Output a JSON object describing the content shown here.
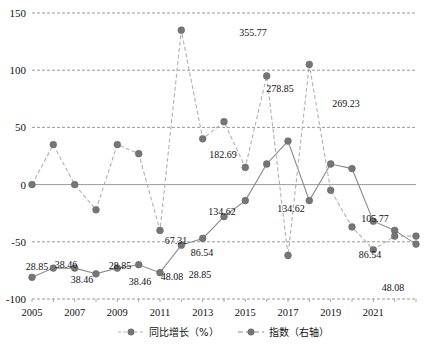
{
  "chart_data": {
    "type": "line",
    "title": "",
    "xlabel": "",
    "ylabel": "",
    "ylim": [
      -100,
      150
    ],
    "y_ticks": [
      150,
      100,
      50,
      0,
      -50,
      -100
    ],
    "grid": true,
    "legend_position": "bottom",
    "x": [
      2005,
      2006,
      2007,
      2008,
      2009,
      2010,
      2011,
      2012,
      2013,
      2014,
      2015,
      2016,
      2017,
      2018,
      2019,
      2020,
      2021,
      2022
    ],
    "x_tick_labels": [
      "2005",
      "2007",
      "2009",
      "2011",
      "2013",
      "2015",
      "2017",
      "2019",
      "2021"
    ],
    "x_ticks": [
      2005,
      2007,
      2009,
      2011,
      2013,
      2015,
      2017,
      2019,
      2021
    ],
    "series": [
      {
        "name": "同比增长（%）",
        "axis": "left",
        "style": "dashed",
        "color": "#a6a6a6",
        "marker_color": "#7f7f7f",
        "values": [
          0,
          35,
          0,
          -22,
          35,
          27,
          -40,
          135,
          40,
          55,
          15,
          95,
          -62,
          105,
          -5,
          -37,
          -57,
          -45
        ],
        "labels": [
          "",
          "",
          "",
          "",
          "",
          "",
          "",
          "",
          "",
          "",
          "",
          "",
          "",
          "",
          "",
          "",
          "",
          ""
        ]
      },
      {
        "name": "指数（右轴）",
        "axis": "right",
        "style": "solid",
        "color": "#808080",
        "marker_color": "#7f7f7f",
        "values": [
          28.85,
          38.46,
          38.46,
          28.85,
          38.46,
          48.08,
          28.85,
          67.31,
          86.54,
          134.62,
          182.69,
          278.85,
          355.77,
          134.62,
          278.85,
          269.23,
          105.77,
          86.54
        ],
        "plot_values": [
          -81,
          -73,
          -73,
          -78,
          -73,
          -70,
          -77,
          -53,
          -47,
          -28,
          -14,
          18,
          38,
          -14,
          18,
          14,
          -32,
          -40
        ],
        "labels": [
          "28.85",
          "38.46",
          "38.46",
          "28.85",
          "38.46",
          "48.08",
          "28.85",
          "67.31",
          "86.54",
          "134.62",
          "182.69",
          "278.85",
          "355.77",
          "134.62",
          "278.85",
          "269.23",
          "105.77",
          "86.54"
        ]
      }
    ],
    "extra_points": [
      {
        "series": "指数（右轴）",
        "x": 2023,
        "value": 48.08,
        "label": "48.08",
        "plot_value": -52
      },
      {
        "series": "同比增长（%）",
        "x": 2023,
        "value": -45,
        "label": ""
      }
    ],
    "visible_data_labels": [
      {
        "text": "28.85",
        "x": 37,
        "y": 270
      },
      {
        "text": "38.46",
        "x": 66,
        "y": 268
      },
      {
        "text": "38.46",
        "x": 82,
        "y": 283
      },
      {
        "text": "28.85",
        "x": 120,
        "y": 269
      },
      {
        "text": "38.46",
        "x": 140,
        "y": 285
      },
      {
        "text": "48.08",
        "x": 172,
        "y": 280
      },
      {
        "text": "28.85",
        "x": 200,
        "y": 278
      },
      {
        "text": "67.31",
        "x": 176,
        "y": 244
      },
      {
        "text": "86.54",
        "x": 202,
        "y": 256
      },
      {
        "text": "134.62",
        "x": 222,
        "y": 215
      },
      {
        "text": "182.69",
        "x": 223,
        "y": 158
      },
      {
        "text": "278.85",
        "x": 280,
        "y": 92
      },
      {
        "text": "355.77",
        "x": 253,
        "y": 36
      },
      {
        "text": "134.62",
        "x": 291,
        "y": 212
      },
      {
        "text": "269.23",
        "x": 346,
        "y": 107
      },
      {
        "text": "105.77",
        "x": 375,
        "y": 222
      },
      {
        "text": "86.54",
        "x": 370,
        "y": 258
      },
      {
        "text": "48.08",
        "x": 393,
        "y": 291
      }
    ]
  },
  "legend": {
    "items": [
      {
        "label": "同比增长（%）",
        "style": "dashed"
      },
      {
        "label": "指数（右轴）",
        "style": "solid"
      }
    ]
  },
  "axis": {
    "y_labels": [
      "150",
      "100",
      "50",
      "0",
      "-50",
      "-100"
    ],
    "x_labels": [
      "2005",
      "2007",
      "2009",
      "2011",
      "2013",
      "2015",
      "2017",
      "2019",
      "2021"
    ]
  },
  "colors": {
    "grid": "#8f8f8f",
    "series_growth": "#b0b0b0",
    "series_index": "#8a8a8a",
    "marker": "#767676",
    "text": "#111111"
  }
}
